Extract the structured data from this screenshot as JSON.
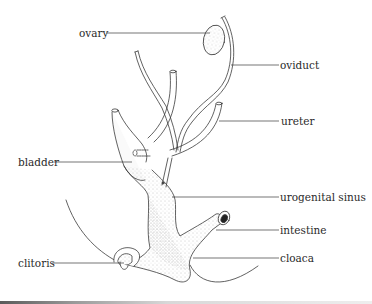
{
  "diagram": {
    "type": "anatomical-illustration",
    "colors": {
      "background": "#ffffff",
      "ink": "#3a3a3a",
      "stipple": "#8a8a8a",
      "leader_line": "#3a3a3a"
    },
    "labels": [
      {
        "id": "ovary",
        "text": "ovary",
        "side": "left",
        "x": 79,
        "y": 27,
        "line_from": [
          106,
          33
        ],
        "line_to": [
          210,
          33
        ]
      },
      {
        "id": "oviduct",
        "text": "oviduct",
        "side": "right",
        "x": 280,
        "y": 59,
        "line_from": [
          231,
          65
        ],
        "line_to": [
          279,
          65
        ]
      },
      {
        "id": "ureter",
        "text": "ureter",
        "side": "right",
        "x": 281,
        "y": 115,
        "line_from": [
          219,
          121
        ],
        "line_to": [
          279,
          121
        ]
      },
      {
        "id": "bladder",
        "text": "bladder",
        "side": "left",
        "x": 18,
        "y": 156,
        "line_from": [
          54,
          162
        ],
        "line_to": [
          132,
          162
        ]
      },
      {
        "id": "urogenital-sinus",
        "text": "urogenital sinus",
        "side": "right",
        "x": 280,
        "y": 191,
        "line_from": [
          172,
          197
        ],
        "line_to": [
          279,
          197
        ]
      },
      {
        "id": "intestine",
        "text": "intestine",
        "side": "right",
        "x": 280,
        "y": 224,
        "line_from": [
          216,
          230
        ],
        "line_to": [
          279,
          230
        ]
      },
      {
        "id": "cloaca",
        "text": "cloaca",
        "side": "right",
        "x": 280,
        "y": 252,
        "line_from": [
          193,
          258
        ],
        "line_to": [
          279,
          258
        ]
      },
      {
        "id": "clitoris",
        "text": "clitoris",
        "side": "left",
        "x": 18,
        "y": 257,
        "line_from": [
          52,
          263
        ],
        "line_to": [
          124,
          263
        ]
      }
    ]
  }
}
